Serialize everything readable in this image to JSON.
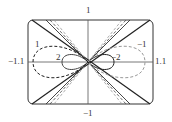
{
  "figure": {
    "type": "family of curves (rose / lemniscate-like loops with asymptotic lines)",
    "axes": {
      "x_min": -1.1,
      "x_max": 1.1,
      "y_min": -1,
      "y_max": 1,
      "tick_labels": {
        "top": "1",
        "bottom": "−1",
        "left": "−1.1",
        "right": "1.1"
      }
    },
    "curve_labels": [
      {
        "id": "c1",
        "text": "1",
        "side": "left",
        "style": "dashed"
      },
      {
        "id": "c2",
        "text": "2",
        "side": "left",
        "style": "solid"
      },
      {
        "id": "cm1",
        "text": "−1",
        "side": "right",
        "style": "dashed-gray"
      },
      {
        "id": "cm2",
        "text": "−2",
        "side": "right",
        "style": "solid"
      }
    ],
    "colors": {
      "axis": "#555555",
      "curve_dark": "#222222",
      "curve_gray": "#888888",
      "background": "#ffffff"
    }
  }
}
